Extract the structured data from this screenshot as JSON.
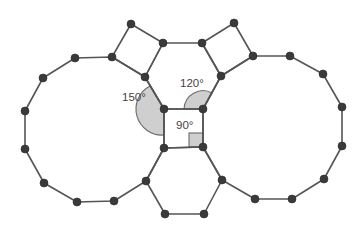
{
  "diagram": {
    "colors": {
      "edge": "#555555",
      "vertex": "#3a3a3a",
      "angle_fill": "#cfcfcf",
      "label": "#444444",
      "background": "#ffffff"
    },
    "labels": {
      "angle_dodecagon": "150°",
      "angle_hexagon": "120°",
      "angle_square": "90°"
    },
    "shapes": [
      {
        "name": "left-dodecagon",
        "sides": 12,
        "interior_angle": 150
      },
      {
        "name": "right-dodecagon",
        "sides": 12,
        "interior_angle": 150
      },
      {
        "name": "top-hexagon",
        "sides": 6,
        "interior_angle": 120
      },
      {
        "name": "bottom-hexagon",
        "sides": 6,
        "interior_angle": 120
      },
      {
        "name": "top-left-square",
        "sides": 4,
        "interior_angle": 90
      },
      {
        "name": "top-right-square",
        "sides": 4,
        "interior_angle": 90
      },
      {
        "name": "center-square",
        "sides": 4,
        "interior_angle": 90
      }
    ]
  }
}
